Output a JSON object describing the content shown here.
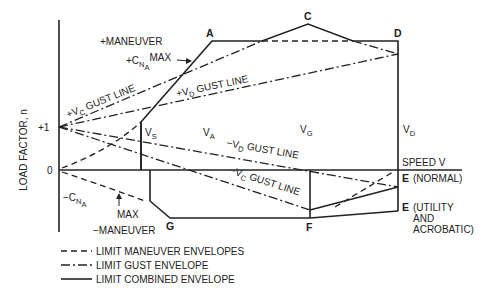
{
  "diagram": {
    "y_axis_label": "LOAD FACTOR, n",
    "y_ticks": [
      "+1",
      "0"
    ],
    "x_axis_label": "SPEED V",
    "points": {
      "A": "A",
      "C": "C",
      "D": "D",
      "G": "G",
      "F": "F",
      "E_normal": "E",
      "E_normal_note": "(NORMAL)",
      "E_utility": "E",
      "E_utility_note_1": "(UTILITY",
      "E_utility_note_2": "AND",
      "E_utility_note_3": "ACROBATIC)"
    },
    "speeds": {
      "vs": {
        "main": "V",
        "sub": "S"
      },
      "va": {
        "main": "V",
        "sub": "A"
      },
      "vg": {
        "main": "V",
        "sub": "G"
      },
      "vd": {
        "main": "V",
        "sub": "D"
      }
    },
    "annotations": {
      "plus_maneuver": "+MANEUVER",
      "plus_cna_pre": "+C",
      "plus_cna_sub": "N",
      "plus_cna_subsub": "A",
      "plus_cna_max": "MAX",
      "minus_cna_pre": "−C",
      "minus_cna_sub": "N",
      "minus_cna_subsub": "A",
      "minus_max": "MAX",
      "minus_maneuver": "−MANEUVER",
      "plus_vc_gust_pre": "+V",
      "plus_vc_gust_sub": "C",
      "plus_vc_gust_post": " GUST LINE",
      "plus_vd_gust_pre": "+V",
      "plus_vd_gust_sub": "D",
      "plus_vd_gust_post": " GUST LINE",
      "minus_vd_gust_pre": "−V",
      "minus_vd_gust_sub": "D",
      "minus_vd_gust_post": " GUST LINE",
      "minus_vc_gust_pre": "−V",
      "minus_vc_gust_sub": "C",
      "minus_vc_gust_post": " GUST LINE"
    },
    "legend": [
      {
        "style": "dashed",
        "label": "LIMIT MANEUVER ENVELOPES"
      },
      {
        "style": "dash-dot",
        "label": "LIMIT GUST ENVELOPE"
      },
      {
        "style": "solid",
        "label": "LIMIT COMBINED ENVELOPE"
      }
    ]
  }
}
